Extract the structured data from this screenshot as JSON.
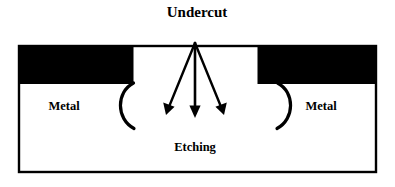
{
  "diagram": {
    "title": "Undercut",
    "process_label": "Etching",
    "regions": [
      {
        "label": "Metal",
        "side": "left"
      },
      {
        "label": "Metal",
        "side": "right"
      }
    ],
    "arrows": [
      {
        "name": "etchant-arrow-left",
        "direction": "down-left"
      },
      {
        "name": "etchant-arrow-center",
        "direction": "down"
      },
      {
        "name": "etchant-arrow-right",
        "direction": "down-right"
      }
    ],
    "undercut_profiles": [
      {
        "name": "undercut-arc-left",
        "shape": "concave-left-bracket"
      },
      {
        "name": "undercut-arc-right",
        "shape": "concave-right-bracket"
      }
    ],
    "colors": {
      "mask": "#000000",
      "substrate": "#ffffff",
      "outline": "#000000",
      "text": "#000000"
    }
  }
}
